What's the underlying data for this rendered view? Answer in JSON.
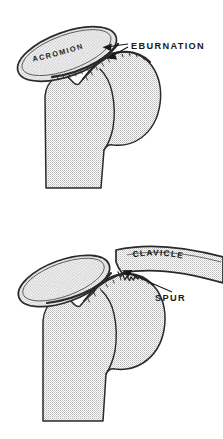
{
  "figure": {
    "background_color": "#ffffff",
    "ink_color": "#1a1a1a",
    "bone_fill_color": "#d8d8d8",
    "stipple_color": "#9a9a9a",
    "panels": [
      {
        "id": "upper",
        "name": "acromiohumeral-eburnation",
        "labels": [
          {
            "id": "acromion",
            "text": "ACROMION",
            "placement": "inside-acromion-rotated"
          },
          {
            "id": "eburnation",
            "text": "EBURNATION",
            "placement": "right-of-joint"
          }
        ],
        "leaders": [
          {
            "from": "eburnation",
            "to": "acromion-undersurface"
          },
          {
            "from": "eburnation",
            "to": "humeral-head-surface"
          }
        ],
        "structures": [
          "acromion",
          "humeral head",
          "humeral shaft",
          "greater tuberosity"
        ]
      },
      {
        "id": "lower",
        "name": "clavicle-spur",
        "labels": [
          {
            "id": "clavicle",
            "text": "CLAVICLE",
            "placement": "inside-clavicle-curved"
          },
          {
            "id": "spur",
            "text": "SPUR",
            "placement": "right-below-clavicle"
          }
        ],
        "leaders": [
          {
            "from": "spur",
            "to": "clavicle-medial-end-spur"
          }
        ],
        "structures": [
          "acromion",
          "clavicle",
          "spur",
          "humeral head",
          "humeral shaft"
        ]
      }
    ]
  }
}
